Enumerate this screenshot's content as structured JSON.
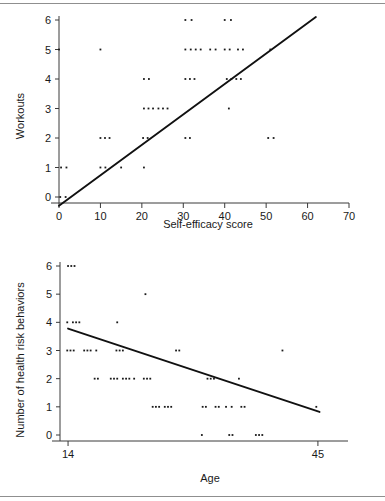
{
  "page": {
    "background_color": "#ffffff",
    "rule_color": "#8f8f8f",
    "text_color": "#1a1a1a",
    "point_color": "#1a1a1a",
    "line_color": "#111111"
  },
  "chart_data": [
    {
      "id": "workouts-vs-self-efficacy",
      "type": "scatter",
      "title": "",
      "xlabel": "Self-efficacy score",
      "ylabel": "Workouts",
      "xlim": [
        0,
        70
      ],
      "ylim": [
        0,
        6
      ],
      "xticks": [
        0,
        10,
        20,
        30,
        40,
        50,
        60,
        70
      ],
      "xtick_labels": [
        "0",
        "10",
        "20",
        "30",
        "40",
        "50",
        "60",
        "70"
      ],
      "yticks": [
        0,
        1,
        2,
        3,
        4,
        5,
        6
      ],
      "ytick_labels": [
        "0",
        "1",
        "2",
        "3",
        "4",
        "5",
        "6"
      ],
      "grid": false,
      "legend": "none",
      "points": [
        {
          "x": 0,
          "y": 5
        },
        {
          "x": 10,
          "y": 5
        },
        {
          "x": 30.5,
          "y": 6
        },
        {
          "x": 32,
          "y": 6
        },
        {
          "x": 40,
          "y": 6
        },
        {
          "x": 41.5,
          "y": 6
        },
        {
          "x": 30.5,
          "y": 5
        },
        {
          "x": 31.8,
          "y": 5
        },
        {
          "x": 33,
          "y": 5
        },
        {
          "x": 34.2,
          "y": 5
        },
        {
          "x": 36.5,
          "y": 5
        },
        {
          "x": 37.8,
          "y": 5
        },
        {
          "x": 40,
          "y": 5
        },
        {
          "x": 41.2,
          "y": 5
        },
        {
          "x": 43.2,
          "y": 5
        },
        {
          "x": 44.4,
          "y": 5
        },
        {
          "x": 51,
          "y": 5
        },
        {
          "x": 20.5,
          "y": 4
        },
        {
          "x": 21.7,
          "y": 4
        },
        {
          "x": 30.5,
          "y": 4
        },
        {
          "x": 31.6,
          "y": 4
        },
        {
          "x": 32.7,
          "y": 4
        },
        {
          "x": 40.5,
          "y": 4
        },
        {
          "x": 41.6,
          "y": 4
        },
        {
          "x": 42.8,
          "y": 4
        },
        {
          "x": 43.9,
          "y": 4
        },
        {
          "x": 20.5,
          "y": 3
        },
        {
          "x": 21.6,
          "y": 3
        },
        {
          "x": 22.7,
          "y": 3
        },
        {
          "x": 24,
          "y": 3
        },
        {
          "x": 25.1,
          "y": 3
        },
        {
          "x": 26.2,
          "y": 3
        },
        {
          "x": 41,
          "y": 3
        },
        {
          "x": 10,
          "y": 2
        },
        {
          "x": 11.1,
          "y": 2
        },
        {
          "x": 12.2,
          "y": 2
        },
        {
          "x": 20.3,
          "y": 2
        },
        {
          "x": 21.4,
          "y": 2
        },
        {
          "x": 30.5,
          "y": 2
        },
        {
          "x": 31.6,
          "y": 2
        },
        {
          "x": 50.5,
          "y": 2
        },
        {
          "x": 51.8,
          "y": 2
        },
        {
          "x": 0.5,
          "y": 1
        },
        {
          "x": 1.8,
          "y": 1
        },
        {
          "x": 10,
          "y": 1
        },
        {
          "x": 11.2,
          "y": 1
        },
        {
          "x": 15,
          "y": 1
        },
        {
          "x": 20.5,
          "y": 1
        },
        {
          "x": 0.3,
          "y": 0
        },
        {
          "x": 1.6,
          "y": 0
        }
      ],
      "fit_line": {
        "x1": 0.0,
        "y1": -0.3,
        "x2": 62.0,
        "y2": 6.1
      }
    },
    {
      "id": "health-risk-behaviors-vs-age",
      "type": "scatter",
      "title": "",
      "xlabel": "Age",
      "ylabel": "Number of health risk behaviors",
      "xlim": [
        13,
        46.5
      ],
      "ylim": [
        0,
        6
      ],
      "xticks": [
        14,
        45
      ],
      "xtick_labels": [
        "14",
        "45"
      ],
      "yticks": [
        0,
        1,
        2,
        3,
        4,
        5,
        6
      ],
      "ytick_labels": [
        "0",
        "1",
        "2",
        "3",
        "4",
        "5",
        "6"
      ],
      "grid": false,
      "legend": "none",
      "points": [
        {
          "x": 14.0,
          "y": 6
        },
        {
          "x": 14.4,
          "y": 6
        },
        {
          "x": 14.8,
          "y": 6
        },
        {
          "x": 23.6,
          "y": 5
        },
        {
          "x": 13.9,
          "y": 4
        },
        {
          "x": 14.6,
          "y": 4
        },
        {
          "x": 15.0,
          "y": 4
        },
        {
          "x": 15.4,
          "y": 4
        },
        {
          "x": 20.1,
          "y": 4
        },
        {
          "x": 13.9,
          "y": 3
        },
        {
          "x": 14.3,
          "y": 3
        },
        {
          "x": 14.7,
          "y": 3
        },
        {
          "x": 16.0,
          "y": 3
        },
        {
          "x": 16.4,
          "y": 3
        },
        {
          "x": 16.8,
          "y": 3
        },
        {
          "x": 17.5,
          "y": 3
        },
        {
          "x": 20.0,
          "y": 3
        },
        {
          "x": 20.4,
          "y": 3
        },
        {
          "x": 20.8,
          "y": 3
        },
        {
          "x": 27.4,
          "y": 3
        },
        {
          "x": 27.8,
          "y": 3
        },
        {
          "x": 40.6,
          "y": 3
        },
        {
          "x": 17.3,
          "y": 2
        },
        {
          "x": 17.7,
          "y": 2
        },
        {
          "x": 19.3,
          "y": 2
        },
        {
          "x": 19.7,
          "y": 2
        },
        {
          "x": 20.1,
          "y": 2
        },
        {
          "x": 20.8,
          "y": 2
        },
        {
          "x": 21.2,
          "y": 2
        },
        {
          "x": 21.6,
          "y": 2
        },
        {
          "x": 22.2,
          "y": 2
        },
        {
          "x": 23.4,
          "y": 2
        },
        {
          "x": 23.8,
          "y": 2
        },
        {
          "x": 24.2,
          "y": 2
        },
        {
          "x": 31.3,
          "y": 2
        },
        {
          "x": 31.7,
          "y": 2
        },
        {
          "x": 32.1,
          "y": 2
        },
        {
          "x": 35.2,
          "y": 2
        },
        {
          "x": 24.5,
          "y": 1
        },
        {
          "x": 24.9,
          "y": 1
        },
        {
          "x": 25.3,
          "y": 1
        },
        {
          "x": 26.0,
          "y": 1
        },
        {
          "x": 26.4,
          "y": 1
        },
        {
          "x": 26.8,
          "y": 1
        },
        {
          "x": 30.7,
          "y": 1
        },
        {
          "x": 31.1,
          "y": 1
        },
        {
          "x": 32.3,
          "y": 1
        },
        {
          "x": 32.7,
          "y": 1
        },
        {
          "x": 33.6,
          "y": 1
        },
        {
          "x": 34.3,
          "y": 1
        },
        {
          "x": 35.5,
          "y": 1
        },
        {
          "x": 35.9,
          "y": 1
        },
        {
          "x": 44.8,
          "y": 1
        },
        {
          "x": 30.6,
          "y": 0
        },
        {
          "x": 34.0,
          "y": 0
        },
        {
          "x": 34.4,
          "y": 0
        },
        {
          "x": 37.3,
          "y": 0
        },
        {
          "x": 37.7,
          "y": 0
        },
        {
          "x": 38.1,
          "y": 0
        }
      ],
      "fit_line": {
        "x1": 14.0,
        "y1": 3.78,
        "x2": 45.2,
        "y2": 0.82
      }
    }
  ]
}
